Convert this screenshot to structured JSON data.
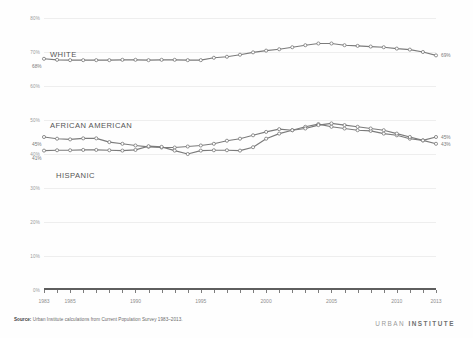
{
  "chart_data": {
    "type": "line",
    "title": "",
    "subtitle": "",
    "xlabel": "",
    "ylabel": "",
    "xlim": [
      1983,
      2013
    ],
    "ylim": [
      0,
      80
    ],
    "grid": true,
    "legend_position": "inline-labels",
    "y_ticks": [
      "0%",
      "10%",
      "20%",
      "30%",
      "40%",
      "50%",
      "60%",
      "70%",
      "80%"
    ],
    "y_tick_values": [
      0,
      10,
      20,
      30,
      40,
      50,
      60,
      70,
      80
    ],
    "x_ticks": [
      "1983",
      "1985",
      "1990",
      "1995",
      "2000",
      "2005",
      "2010",
      "2013"
    ],
    "x_tick_values": [
      1983,
      1985,
      1990,
      1995,
      2000,
      2005,
      2010,
      2013
    ],
    "x": [
      1983,
      1984,
      1985,
      1986,
      1987,
      1988,
      1989,
      1990,
      1991,
      1992,
      1993,
      1994,
      1995,
      1996,
      1997,
      1998,
      1999,
      2000,
      2001,
      2002,
      2003,
      2004,
      2005,
      2006,
      2007,
      2008,
      2009,
      2010,
      2011,
      2012,
      2013
    ],
    "series": [
      {
        "name": "WHITE",
        "color": "#7b7b7b",
        "start_label": "68%",
        "end_label": "69%",
        "values": [
          68.0,
          67.7,
          67.6,
          67.6,
          67.6,
          67.6,
          67.7,
          67.7,
          67.6,
          67.7,
          67.7,
          67.6,
          67.6,
          68.3,
          68.6,
          69.2,
          69.9,
          70.4,
          70.8,
          71.4,
          72.0,
          72.5,
          72.5,
          72.0,
          71.8,
          71.6,
          71.4,
          71.0,
          70.7,
          70.0,
          69.0
        ]
      },
      {
        "name": "AFRICAN AMERICAN",
        "color": "#6f6f6f",
        "start_label": "45%",
        "end_label": "45%",
        "values": [
          45.0,
          44.5,
          44.3,
          44.6,
          44.6,
          43.5,
          43.0,
          42.5,
          42.1,
          41.9,
          41.9,
          42.2,
          42.5,
          43.0,
          43.9,
          44.5,
          45.5,
          46.5,
          47.3,
          47.0,
          48.0,
          48.8,
          48.0,
          47.5,
          47.0,
          46.8,
          46.0,
          45.5,
          44.5,
          44.0,
          45.0
        ]
      },
      {
        "name": "HISPANIC",
        "color": "#6f6f6f",
        "start_label": "41%",
        "end_label": "43%",
        "values": [
          41.0,
          41.1,
          41.1,
          41.2,
          41.2,
          41.1,
          41.0,
          41.2,
          42.3,
          42.1,
          41.0,
          40.0,
          41.0,
          41.1,
          41.1,
          41.0,
          42.0,
          44.5,
          46.0,
          47.0,
          47.5,
          48.5,
          49.0,
          48.5,
          48.0,
          47.5,
          47.0,
          46.0,
          45.0,
          44.0,
          43.0
        ]
      }
    ]
  },
  "footer": {
    "source_prefix": "Source:",
    "source_text": "Urban Institute calculations from Current Population Survey 1983–2013.",
    "logo_light": "URBAN",
    "logo_bold": "INSTITUTE"
  }
}
